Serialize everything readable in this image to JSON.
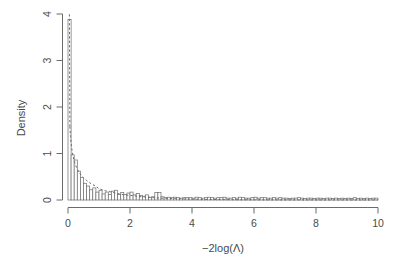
{
  "figure": {
    "title_clipped": "",
    "background_color": "#ffffff",
    "foreground_color": "#4a4a4a"
  },
  "chart_data": {
    "type": "bar",
    "title": "",
    "subtitle": "",
    "xlabel": "−2log(Λ)",
    "ylabel": "Density",
    "xlim": [
      0,
      10
    ],
    "ylim": [
      0,
      4
    ],
    "xticks": [
      0,
      2,
      4,
      6,
      8,
      10
    ],
    "xtick_labels": [
      "0",
      "2",
      "4",
      "6",
      "8",
      "10"
    ],
    "yticks": [
      0,
      1,
      2,
      3,
      4
    ],
    "ytick_labels": [
      "0",
      "1",
      "2",
      "3",
      "4"
    ],
    "grid": false,
    "legend": null,
    "bar_edge_color": "#6b6b6b",
    "bar_fill_color": "#ffffff",
    "bin_width": 0.1,
    "bin_starts": [
      0.0,
      0.1,
      0.2,
      0.3,
      0.4,
      0.5,
      0.6,
      0.7,
      0.8,
      0.9,
      1.0,
      1.1,
      1.2,
      1.3,
      1.4,
      1.5,
      1.6,
      1.7,
      1.8,
      1.9,
      2.0,
      2.1,
      2.2,
      2.3,
      2.4,
      2.5,
      2.6,
      2.7,
      2.8,
      2.9,
      3.0,
      3.1,
      3.2,
      3.3,
      3.4,
      3.5,
      3.6,
      3.7,
      3.8,
      3.9,
      4.0,
      4.1,
      4.2,
      4.3,
      4.4,
      4.5,
      4.6,
      4.7,
      4.8,
      4.9,
      5.0,
      5.1,
      5.2,
      5.3,
      5.4,
      5.5,
      5.6,
      5.7,
      5.8,
      5.9,
      6.0,
      6.1,
      6.2,
      6.3,
      6.4,
      6.5,
      6.6,
      6.7,
      6.8,
      6.9,
      7.0,
      7.1,
      7.2,
      7.3,
      7.4,
      7.5,
      7.6,
      7.7,
      7.8,
      7.9,
      8.0,
      8.1,
      8.2,
      8.3,
      8.4,
      8.5,
      8.6,
      8.7,
      8.8,
      8.9,
      9.0,
      9.1,
      9.2,
      9.3,
      9.4,
      9.5,
      9.6,
      9.7,
      9.8,
      9.9
    ],
    "values": [
      3.88,
      0.97,
      0.86,
      0.62,
      0.48,
      0.36,
      0.3,
      0.22,
      0.26,
      0.17,
      0.21,
      0.13,
      0.17,
      0.12,
      0.19,
      0.21,
      0.12,
      0.16,
      0.12,
      0.15,
      0.17,
      0.11,
      0.14,
      0.1,
      0.08,
      0.11,
      0.06,
      0.07,
      0.16,
      0.16,
      0.07,
      0.05,
      0.06,
      0.05,
      0.06,
      0.05,
      0.04,
      0.05,
      0.05,
      0.05,
      0.04,
      0.06,
      0.05,
      0.04,
      0.05,
      0.06,
      0.05,
      0.04,
      0.05,
      0.05,
      0.06,
      0.04,
      0.04,
      0.05,
      0.04,
      0.06,
      0.05,
      0.04,
      0.04,
      0.05,
      0.06,
      0.04,
      0.05,
      0.05,
      0.04,
      0.04,
      0.05,
      0.04,
      0.05,
      0.04,
      0.04,
      0.03,
      0.04,
      0.04,
      0.05,
      0.04,
      0.03,
      0.04,
      0.04,
      0.03,
      0.04,
      0.04,
      0.03,
      0.04,
      0.04,
      0.03,
      0.04,
      0.03,
      0.04,
      0.03,
      0.04,
      0.03,
      0.05,
      0.03,
      0.04,
      0.03,
      0.04,
      0.03,
      0.04,
      0.04
    ],
    "overlay_curve": {
      "name": "chi-square density (1 df)",
      "style": "dashed",
      "color": "#6b6b6b",
      "x": [
        0.06,
        0.08,
        0.1,
        0.13,
        0.16,
        0.2,
        0.25,
        0.3,
        0.36,
        0.43,
        0.5,
        0.6,
        0.7,
        0.8,
        0.9,
        1.0,
        1.2,
        1.4,
        1.6,
        1.8,
        2.0,
        2.3,
        2.6,
        3.0,
        3.4,
        3.8,
        4.2,
        4.7,
        5.2,
        5.8,
        6.4,
        7.0,
        7.8,
        8.6,
        9.4,
        10.0
      ],
      "y": [
        1.58,
        1.37,
        1.22,
        1.07,
        0.95,
        0.84,
        0.74,
        0.66,
        0.59,
        0.53,
        0.48,
        0.42,
        0.37,
        0.33,
        0.3,
        0.24,
        0.2,
        0.17,
        0.14,
        0.11,
        0.1,
        0.075,
        0.058,
        0.04,
        0.029,
        0.021,
        0.015,
        0.01,
        0.007,
        0.004,
        0.0028,
        0.0018,
        0.001,
        0.0006,
        0.0003,
        0.0002
      ]
    }
  },
  "axes": {
    "y_axis_title": "Density",
    "x_axis_title": "−2log(Λ)"
  }
}
